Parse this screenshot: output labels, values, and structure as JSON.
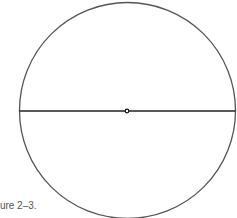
{
  "figure": {
    "caption": "Figure 2–3.",
    "shape": "circle-with-diameter",
    "circle": {
      "cx": 127.5,
      "cy": 110.5,
      "r": 108,
      "stroke": "#555555"
    },
    "diameter": {
      "y": 111,
      "x1": 19.5,
      "x2": 235.5,
      "stroke": "#222222"
    },
    "center_point": {
      "cx": 127,
      "cy": 111
    }
  }
}
